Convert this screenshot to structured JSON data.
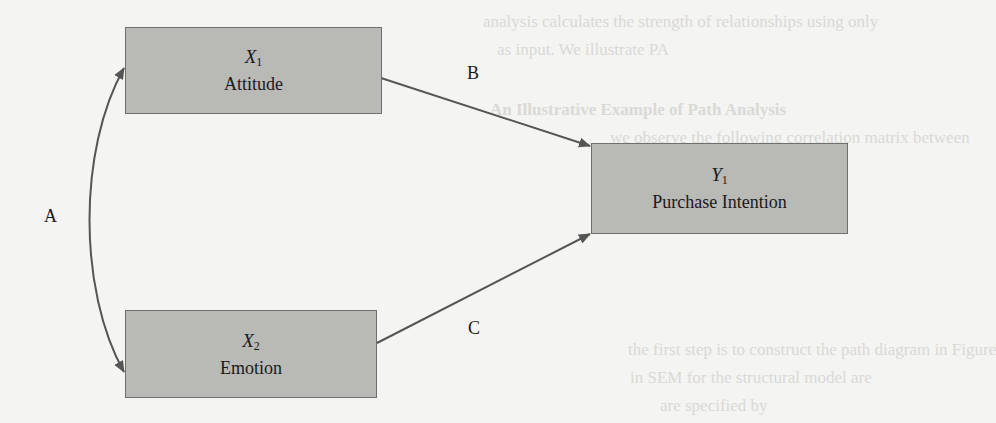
{
  "background_text": {
    "line1": "analysis calculates the strength of relationships using only",
    "line2": "as input. We illustrate PA",
    "heading": "An Illustrative Example of Path Analysis",
    "line3": "we observe the following correlation matrix between",
    "line4": "the first step is to construct the path diagram in Figure",
    "line5": "in SEM for the structural model are",
    "line6": "are specified by"
  },
  "nodes": {
    "x1": {
      "symbol": "X",
      "subscript": "1",
      "label": "Attitude"
    },
    "x2": {
      "symbol": "X",
      "subscript": "2",
      "label": "Emotion"
    },
    "y1": {
      "symbol": "Y",
      "subscript": "1",
      "label": "Purchase Intention"
    }
  },
  "edges": {
    "a": {
      "label": "A",
      "from": "X1",
      "to": "X2",
      "type": "correlation (two-headed curved arrow)"
    },
    "b": {
      "label": "B",
      "from": "X1",
      "to": "Y1",
      "type": "directed path"
    },
    "c": {
      "label": "C",
      "from": "X2",
      "to": "Y1",
      "type": "directed path"
    }
  },
  "colors": {
    "box_fill": "#b9b9b6",
    "box_border": "#6f6f6c",
    "arrow": "#555555",
    "background": "#f4f4f2"
  }
}
